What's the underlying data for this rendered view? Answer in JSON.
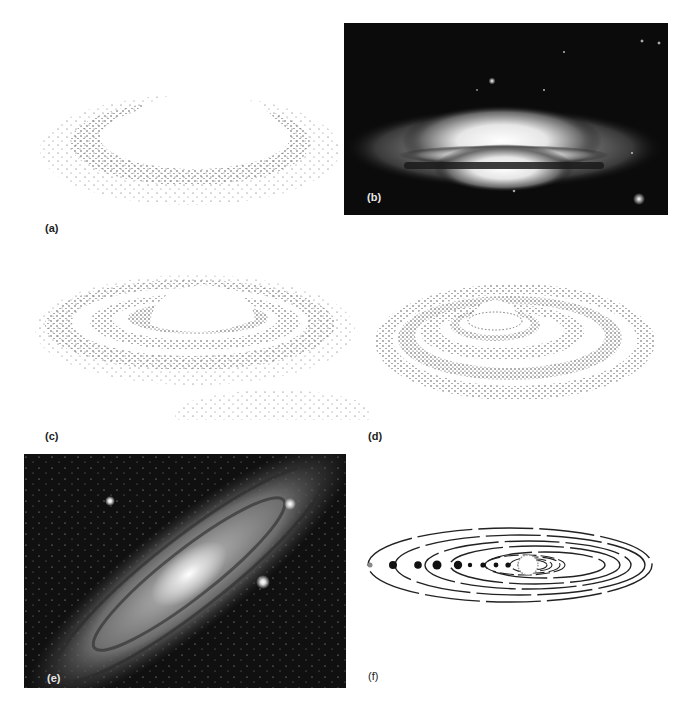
{
  "figure": {
    "panels": [
      {
        "id": "a",
        "label": "(a)",
        "type": "drawing",
        "depicts": "contracting rotating cloud with flattening disk of particles"
      },
      {
        "id": "b",
        "label": "(b)",
        "type": "photograph",
        "depicts": "edge-on galaxy with bright central bulge and dark dust lane"
      },
      {
        "id": "c",
        "label": "(c)",
        "type": "drawing",
        "depicts": "flattened disk forming rings around central bulge"
      },
      {
        "id": "d",
        "label": "(d)",
        "type": "drawing",
        "depicts": "concentric rings of particles around central body"
      },
      {
        "id": "e",
        "label": "(e)",
        "type": "photograph",
        "depicts": "spiral galaxy with bright core and dust lanes, inclined view"
      },
      {
        "id": "f",
        "label": "(f)",
        "type": "drawing",
        "depicts": "solar system: sun with planets on dashed elliptical orbits"
      }
    ]
  },
  "colors": {
    "background": "#ffffff",
    "ink": "#222222",
    "photo_bg": "#0b0b0b",
    "glow": "#f4f4f4"
  }
}
